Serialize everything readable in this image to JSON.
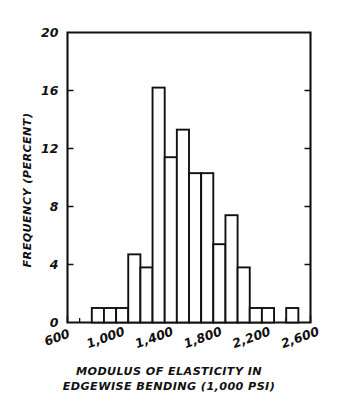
{
  "chart_data": {
    "type": "bar",
    "title": "",
    "subtitle": "",
    "xlabel_line1": "MODULUS OF ELASTICITY IN",
    "xlabel_line2": "EDGEWISE BENDING (1,000 PSI)",
    "ylabel": "FREQUENCY (PERCENT)",
    "xlim": [
      600,
      2600
    ],
    "ylim": [
      0,
      20
    ],
    "grid": false,
    "legend": "none",
    "bin_width": 100,
    "x_ticks": [
      600,
      1000,
      1400,
      1800,
      2200,
      2600
    ],
    "x_tick_labels": [
      "600",
      "1,000",
      "1,400",
      "1,800",
      "2,200",
      "2,600"
    ],
    "x_minor_tick_step": 100,
    "y_ticks": [
      0,
      4,
      8,
      12,
      16,
      20
    ],
    "y_tick_labels": [
      "0",
      "4",
      "8",
      "12",
      "16",
      "20"
    ],
    "bins": [
      {
        "x0": 800,
        "x1": 900,
        "value": 1.0
      },
      {
        "x0": 900,
        "x1": 1000,
        "value": 1.0
      },
      {
        "x0": 1000,
        "x1": 1100,
        "value": 1.0
      },
      {
        "x0": 1100,
        "x1": 1200,
        "value": 4.7
      },
      {
        "x0": 1200,
        "x1": 1300,
        "value": 3.8
      },
      {
        "x0": 1300,
        "x1": 1400,
        "value": 16.2
      },
      {
        "x0": 1400,
        "x1": 1500,
        "value": 11.4
      },
      {
        "x0": 1500,
        "x1": 1600,
        "value": 13.3
      },
      {
        "x0": 1600,
        "x1": 1700,
        "value": 10.3
      },
      {
        "x0": 1700,
        "x1": 1800,
        "value": 10.3
      },
      {
        "x0": 1800,
        "x1": 1900,
        "value": 5.4
      },
      {
        "x0": 1900,
        "x1": 2000,
        "value": 7.4
      },
      {
        "x0": 2000,
        "x1": 2100,
        "value": 3.8
      },
      {
        "x0": 2100,
        "x1": 2200,
        "value": 1.0
      },
      {
        "x0": 2200,
        "x1": 2300,
        "value": 1.0
      },
      {
        "x0": 2400,
        "x1": 2500,
        "value": 1.0
      }
    ],
    "categories": [
      "800-900",
      "900-1000",
      "1000-1100",
      "1100-1200",
      "1200-1300",
      "1300-1400",
      "1400-1500",
      "1500-1600",
      "1600-1700",
      "1700-1800",
      "1800-1900",
      "1900-2000",
      "2000-2100",
      "2100-2200",
      "2200-2300",
      "2400-2500"
    ],
    "values": [
      1.0,
      1.0,
      1.0,
      4.7,
      3.8,
      16.2,
      11.4,
      13.3,
      10.3,
      10.3,
      5.4,
      7.4,
      3.8,
      1.0,
      1.0,
      1.0
    ],
    "colors": {
      "line": "#111111",
      "fill": "#ffffff",
      "background": "#ffffff"
    }
  }
}
